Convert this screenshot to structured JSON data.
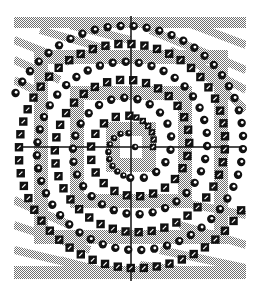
{
  "diagram": {
    "title": "",
    "type": "double-spiral",
    "canvas": {
      "width": 258,
      "height": 290,
      "background": "#ffffff"
    },
    "pattern_area": {
      "x": 14,
      "y": 17,
      "width": 232,
      "height": 262
    },
    "center": {
      "x": 131,
      "y": 147
    },
    "axes": {
      "horizontal": {
        "y": 147,
        "x1": 15,
        "x2": 245
      },
      "vertical": {
        "x": 131,
        "y1": 16,
        "y2": 281
      },
      "color": "#111111"
    },
    "colors": {
      "band_gray": "#a8a8a8",
      "band_dark": "#8c8c8c",
      "marker_fill": "#111111",
      "marker_highlight": "#ffffff"
    },
    "series": [
      {
        "name": "circles",
        "marker": "circle",
        "phase_offset_px": 0
      },
      {
        "name": "squares",
        "marker": "square",
        "phase_offset_px": 18
      }
    ],
    "spiral": {
      "pitch_px": 36,
      "start_radius": 4,
      "max_radius": 130
    }
  }
}
